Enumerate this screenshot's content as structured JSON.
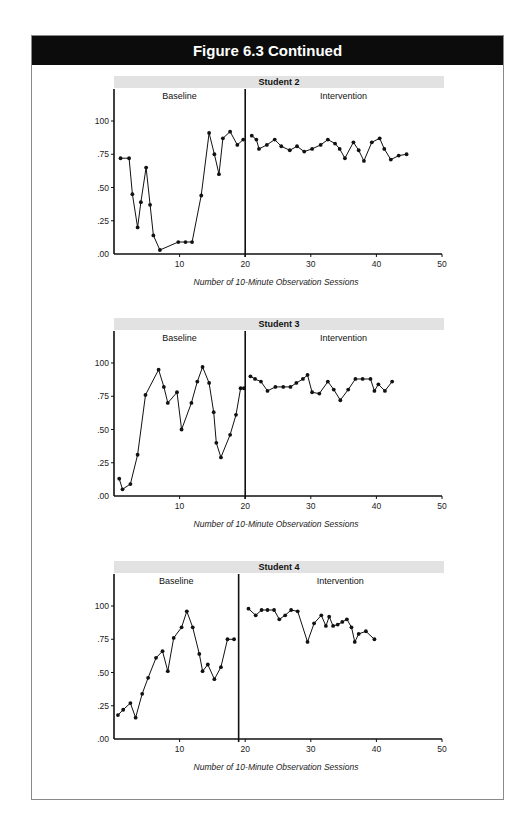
{
  "figure": {
    "title": "Figure 6.3 Continued"
  },
  "colors": {
    "header_bg": "#0c0c0c",
    "header_text": "#ffffff",
    "title_band": "#e2e2e2",
    "line": "#111111"
  },
  "chart_data": [
    {
      "type": "line",
      "title": "Student 2",
      "xlabel": "Number of 10-Minute Observation Sessions",
      "ylabel": "",
      "phases": [
        "Baseline",
        "Intervention"
      ],
      "phase_change_x": 20,
      "xlim": [
        0,
        50
      ],
      "ylim": [
        0,
        1.2
      ],
      "x_ticks": [
        10,
        20,
        30,
        40,
        50
      ],
      "x_tick_labels": [
        "10",
        "20",
        "30",
        "40",
        "50"
      ],
      "y_ticks": [
        0,
        0.25,
        0.5,
        0.75,
        1.0
      ],
      "y_tick_labels": [
        ".00",
        ".25",
        ".50",
        ".75",
        "100"
      ],
      "grid": false,
      "series": [
        {
          "name": "Baseline",
          "x": [
            1,
            2.3,
            2.8,
            3.6,
            4.1,
            4.9,
            5.5,
            6,
            7,
            9.8,
            10.9,
            11.9,
            13.3,
            14.5,
            15.3,
            16,
            16.6,
            17.7,
            18.8,
            19.7
          ],
          "y": [
            0.72,
            0.72,
            0.45,
            0.2,
            0.39,
            0.65,
            0.37,
            0.14,
            0.03,
            0.09,
            0.09,
            0.09,
            0.44,
            0.91,
            0.75,
            0.6,
            0.87,
            0.92,
            0.82,
            0.86
          ]
        },
        {
          "name": "Intervention",
          "x": [
            21,
            21.7,
            22.1,
            23.3,
            24.5,
            25.5,
            26.8,
            27.9,
            29,
            30.2,
            31.5,
            32.6,
            33.7,
            34.4,
            35.2,
            36.5,
            37.3,
            38.1,
            39.3,
            40.5,
            41.2,
            42.2,
            43.4,
            44.6
          ],
          "y": [
            0.89,
            0.86,
            0.79,
            0.82,
            0.86,
            0.81,
            0.78,
            0.81,
            0.77,
            0.79,
            0.82,
            0.86,
            0.83,
            0.79,
            0.72,
            0.84,
            0.78,
            0.7,
            0.84,
            0.87,
            0.79,
            0.71,
            0.74,
            0.75
          ]
        }
      ]
    },
    {
      "type": "line",
      "title": "Student 3",
      "xlabel": "Number of 10-Minute Observation Sessions",
      "ylabel": "",
      "phases": [
        "Baseline",
        "Intervention"
      ],
      "phase_change_x": 20,
      "xlim": [
        0,
        50
      ],
      "ylim": [
        0,
        1.2
      ],
      "x_ticks": [
        10,
        20,
        30,
        40,
        50
      ],
      "x_tick_labels": [
        "10",
        "20",
        "30",
        "40",
        "50"
      ],
      "y_ticks": [
        0,
        0.25,
        0.5,
        0.75,
        1.0
      ],
      "y_tick_labels": [
        ".00",
        ".25",
        ".50",
        ".75",
        "100"
      ],
      "grid": false,
      "series": [
        {
          "name": "Baseline",
          "x": [
            0.8,
            1.3,
            2.5,
            3.6,
            4.8,
            6.8,
            7.6,
            8.2,
            9.6,
            10.3,
            11.8,
            12.7,
            13.5,
            14.5,
            15.2,
            15.6,
            16.3,
            17.7,
            18.6,
            19.3,
            19.8
          ],
          "y": [
            0.13,
            0.05,
            0.09,
            0.31,
            0.76,
            0.95,
            0.82,
            0.7,
            0.78,
            0.5,
            0.7,
            0.86,
            0.97,
            0.85,
            0.63,
            0.4,
            0.29,
            0.46,
            0.61,
            0.81,
            0.81
          ]
        },
        {
          "name": "Intervention",
          "x": [
            20.8,
            21.5,
            22.4,
            23.4,
            24.6,
            25.8,
            26.9,
            27.8,
            28.8,
            29.5,
            30.2,
            31.3,
            32.6,
            33.5,
            34.5,
            35.7,
            36.8,
            37.9,
            39.1,
            39.7,
            40.3,
            41.3,
            42.4
          ],
          "y": [
            0.9,
            0.88,
            0.86,
            0.79,
            0.82,
            0.82,
            0.82,
            0.85,
            0.88,
            0.91,
            0.78,
            0.77,
            0.86,
            0.8,
            0.72,
            0.8,
            0.88,
            0.88,
            0.88,
            0.79,
            0.84,
            0.79,
            0.86
          ]
        }
      ]
    },
    {
      "type": "line",
      "title": "Student 4",
      "xlabel": "Number of 10-Minute Observation Sessions",
      "ylabel": "",
      "phases": [
        "Baseline",
        "Intervention"
      ],
      "phase_change_x": 19,
      "xlim": [
        0,
        50
      ],
      "ylim": [
        0,
        1.2
      ],
      "x_ticks": [
        10,
        20,
        30,
        40,
        50
      ],
      "x_tick_labels": [
        "10",
        "20",
        "30",
        "40",
        "50"
      ],
      "y_ticks": [
        0,
        0.25,
        0.5,
        0.75,
        1.0
      ],
      "y_tick_labels": [
        ".00",
        ".25",
        ".50",
        ".75",
        "100"
      ],
      "grid": false,
      "series": [
        {
          "name": "Baseline",
          "x": [
            0.6,
            1.4,
            2.5,
            3.3,
            4.3,
            5.2,
            6.4,
            7.4,
            8.2,
            9.1,
            10.3,
            11.1,
            12,
            13,
            13.5,
            14.3,
            15.3,
            16.3,
            17.3,
            18.3
          ],
          "y": [
            0.18,
            0.22,
            0.27,
            0.16,
            0.34,
            0.46,
            0.61,
            0.66,
            0.51,
            0.76,
            0.84,
            0.96,
            0.84,
            0.64,
            0.51,
            0.56,
            0.45,
            0.54,
            0.75,
            0.75
          ]
        },
        {
          "name": "Intervention",
          "x": [
            20.5,
            21.6,
            22.5,
            23.4,
            24.4,
            25.2,
            26.1,
            27,
            28,
            29.5,
            30.5,
            31.6,
            32.3,
            32.8,
            33.4,
            34.1,
            34.8,
            35.5,
            36.2,
            36.7,
            37.3,
            38.4,
            39.7
          ],
          "y": [
            0.98,
            0.93,
            0.97,
            0.97,
            0.97,
            0.9,
            0.93,
            0.97,
            0.96,
            0.73,
            0.87,
            0.93,
            0.85,
            0.92,
            0.85,
            0.86,
            0.88,
            0.9,
            0.84,
            0.73,
            0.79,
            0.81,
            0.75
          ]
        }
      ]
    }
  ]
}
